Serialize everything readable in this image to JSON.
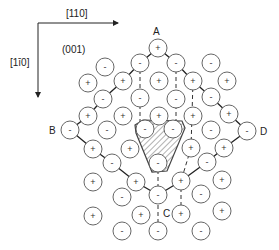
{
  "axes": {
    "horizontal_label": "[110]",
    "vertical_label": "[1ī0]",
    "plane_label": "(001)"
  },
  "corner_labels": {
    "A": "A",
    "B": "B",
    "C": "C",
    "D": "D"
  },
  "ions": [
    {
      "x": 158,
      "y": 48,
      "sign": "+"
    },
    {
      "x": 140,
      "y": 63,
      "sign": "-"
    },
    {
      "x": 176,
      "y": 63,
      "sign": "-"
    },
    {
      "x": 211,
      "y": 63,
      "sign": "-"
    },
    {
      "x": 105,
      "y": 67,
      "sign": "-"
    },
    {
      "x": 88,
      "y": 83,
      "sign": "+"
    },
    {
      "x": 123,
      "y": 81,
      "sign": "+"
    },
    {
      "x": 159,
      "y": 81,
      "sign": "+"
    },
    {
      "x": 193,
      "y": 81,
      "sign": "+"
    },
    {
      "x": 227,
      "y": 81,
      "sign": "+"
    },
    {
      "x": 103,
      "y": 99,
      "sign": "-"
    },
    {
      "x": 140,
      "y": 98,
      "sign": "-"
    },
    {
      "x": 176,
      "y": 99,
      "sign": "-"
    },
    {
      "x": 211,
      "y": 97,
      "sign": "-"
    },
    {
      "x": 88,
      "y": 116,
      "sign": "+"
    },
    {
      "x": 123,
      "y": 116,
      "sign": "+"
    },
    {
      "x": 159,
      "y": 116,
      "sign": "+"
    },
    {
      "x": 193,
      "y": 116,
      "sign": "+"
    },
    {
      "x": 229,
      "y": 114,
      "sign": "+"
    },
    {
      "x": 70,
      "y": 130,
      "sign": "-"
    },
    {
      "x": 107,
      "y": 130,
      "sign": "-"
    },
    {
      "x": 145,
      "y": 129,
      "sign": "-"
    },
    {
      "x": 173,
      "y": 129,
      "sign": "-"
    },
    {
      "x": 211,
      "y": 130,
      "sign": "-"
    },
    {
      "x": 247,
      "y": 131,
      "sign": "-"
    },
    {
      "x": 93,
      "y": 149,
      "sign": "+"
    },
    {
      "x": 130,
      "y": 149,
      "sign": "+"
    },
    {
      "x": 191,
      "y": 148,
      "sign": "+"
    },
    {
      "x": 224,
      "y": 148,
      "sign": "+"
    },
    {
      "x": 112,
      "y": 163,
      "sign": "-"
    },
    {
      "x": 158,
      "y": 163,
      "sign": "-"
    },
    {
      "x": 207,
      "y": 162,
      "sign": "-"
    },
    {
      "x": 93,
      "y": 182,
      "sign": "+"
    },
    {
      "x": 136,
      "y": 182,
      "sign": "+"
    },
    {
      "x": 181,
      "y": 181,
      "sign": "+"
    },
    {
      "x": 222,
      "y": 180,
      "sign": "+"
    },
    {
      "x": 122,
      "y": 197,
      "sign": "-"
    },
    {
      "x": 158,
      "y": 195,
      "sign": "-"
    },
    {
      "x": 201,
      "y": 194,
      "sign": "-"
    },
    {
      "x": 93,
      "y": 216,
      "sign": "+"
    },
    {
      "x": 141,
      "y": 215,
      "sign": "+"
    },
    {
      "x": 181,
      "y": 214,
      "sign": "+"
    },
    {
      "x": 222,
      "y": 211,
      "sign": "+"
    },
    {
      "x": 122,
      "y": 231,
      "sign": "-"
    },
    {
      "x": 158,
      "y": 231,
      "sign": "-"
    },
    {
      "x": 201,
      "y": 231,
      "sign": "-"
    }
  ],
  "colors": {
    "line": "#222222",
    "circle": "#555555",
    "hatch": "#666666"
  }
}
